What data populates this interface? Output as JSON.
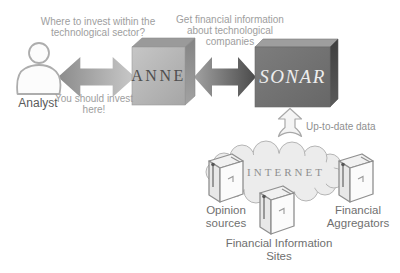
{
  "texts": {
    "analyst_question": [
      "Where to invest within the",
      "technological sector?"
    ],
    "sonar_request": [
      "Get financial information",
      "about technological",
      "companies"
    ],
    "anne_answer": [
      "You should invest",
      "here!"
    ],
    "up_to_date": "Up-to-date data"
  },
  "nodes": {
    "analyst": "Analyst",
    "anne": "ANNE",
    "sonar": "SONAR",
    "internet": "INTERNET"
  },
  "sources": {
    "opinion": [
      "Opinion",
      "sources"
    ],
    "financial_sites": [
      "Financial Information",
      "Sites"
    ],
    "aggregators": [
      "Financial",
      "Aggregators"
    ]
  },
  "icons": [
    "analyst-person-icon",
    "double-arrow-icon",
    "up-arrow-icon",
    "internet-cloud-icon",
    "server-icon"
  ],
  "colors": {
    "annotation_text": "#9e9e9e",
    "caption_text": "#6f6f6f",
    "anne_front": "#b4b4b4",
    "anne_side": "#8e8e8e",
    "sonar_front": "#707070",
    "sonar_side": "#4a4a4a",
    "cloud_fill": "#ececec",
    "cloud_stroke": "#b5b5b5",
    "arrow_light": "#c9c9c9",
    "arrow_dark": "#4a4a4a"
  }
}
